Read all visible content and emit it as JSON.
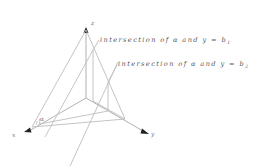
{
  "diagram": {
    "axes": {
      "x_label": "x",
      "y_label": "y",
      "z_label": "z"
    },
    "plane_label": "α",
    "annotations": [
      {
        "text": "intersection of α and y = b",
        "subscript": "1"
      },
      {
        "text": "intersection of α and y = b",
        "subscript": "2"
      }
    ],
    "colors": {
      "lines": "#bdbdbd",
      "arrows": "#222222",
      "text": "#555555"
    }
  }
}
